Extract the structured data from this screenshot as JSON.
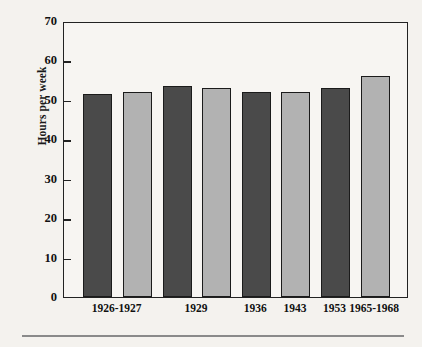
{
  "chart_data": {
    "type": "bar",
    "title": "",
    "xlabel": "",
    "ylabel": "Hours per week",
    "ylim": [
      0,
      70
    ],
    "yticks": [
      0,
      10,
      20,
      30,
      40,
      50,
      60,
      70
    ],
    "ytick_labels": [
      "0",
      "10",
      "20",
      "30",
      "40",
      "50",
      "60",
      "70"
    ],
    "grid": false,
    "legend": "none",
    "categories": [
      "1926-1927",
      "1929",
      "1936",
      "1943",
      "1953",
      "1965-1968"
    ],
    "bars": [
      {
        "category": "1926-1927",
        "series": "dark",
        "value": 51.5
      },
      {
        "category": "1926-1927",
        "series": "light",
        "value": 52.0
      },
      {
        "category": "1929",
        "series": "dark",
        "value": 53.5
      },
      {
        "category": "1929",
        "series": "light",
        "value": 53.0
      },
      {
        "category": "1936",
        "series": "dark",
        "value": 52.0
      },
      {
        "category": "1943",
        "series": "light",
        "value": 52.0
      },
      {
        "category": "1953",
        "series": "dark",
        "value": 53.0
      },
      {
        "category": "1965-1968",
        "series": "light",
        "value": 56.0
      }
    ],
    "series": [
      {
        "name": "dark",
        "color": "#4a4a4a"
      },
      {
        "name": "light",
        "color": "#b2b2b2"
      }
    ],
    "colors": {
      "dark_bar": "#4a4a4a",
      "light_bar": "#b2b2b2",
      "bar_outline": "#1b1b1b",
      "axis": "#222222",
      "background": "#f4f2ee",
      "plot_background": "#f7f5f2",
      "rule": "#8a8a8a"
    }
  }
}
